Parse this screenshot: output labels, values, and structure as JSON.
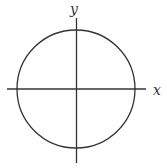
{
  "diagram": {
    "type": "unit-circle-on-axes",
    "x_axis_label": "x",
    "y_axis_label": "y",
    "stroke_color": "#333333",
    "background": "#ffffff"
  }
}
